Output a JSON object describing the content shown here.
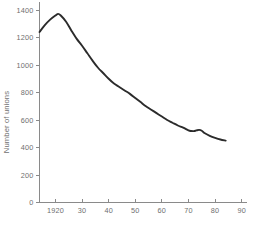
{
  "chart_data": {
    "type": "line",
    "title": "",
    "subtitle": "",
    "xlabel": "",
    "ylabel": "Number of unions",
    "xlim": [
      1914,
      1992
    ],
    "ylim": [
      0,
      1600
    ],
    "grid": false,
    "legend": null,
    "legend_position": "none",
    "y_ticks": [
      0,
      200,
      400,
      600,
      800,
      1000,
      1200,
      1400,
      1600
    ],
    "y_tick_labels": [
      "0",
      "200",
      "400",
      "600",
      "800",
      "1000",
      "1200",
      "1400",
      "1600"
    ],
    "y_top_label_clipped": true,
    "x_ticks": [
      1920,
      1930,
      1940,
      1950,
      1960,
      1970,
      1980,
      1990
    ],
    "x_tick_labels": [
      "1920",
      "30",
      "40",
      "50",
      "60",
      "70",
      "80",
      "90"
    ],
    "line_color": "#2b2b2b",
    "axis_color": "#8a8a8a",
    "text_color": "#6f6f6f",
    "background_color": "#ffffff",
    "series": [
      {
        "name": "Number of unions",
        "x": [
          1914,
          1916,
          1918,
          1920,
          1921,
          1922,
          1924,
          1926,
          1928,
          1930,
          1932,
          1934,
          1936,
          1938,
          1940,
          1942,
          1944,
          1946,
          1948,
          1950,
          1952,
          1954,
          1956,
          1958,
          1960,
          1962,
          1964,
          1966,
          1968,
          1970,
          1971,
          1972,
          1973,
          1974,
          1975,
          1976,
          1978,
          1980,
          1982,
          1984
        ],
        "values": [
          1240,
          1290,
          1330,
          1360,
          1372,
          1360,
          1315,
          1250,
          1190,
          1140,
          1085,
          1030,
          980,
          940,
          900,
          865,
          840,
          815,
          790,
          760,
          730,
          700,
          675,
          650,
          625,
          600,
          580,
          560,
          545,
          525,
          520,
          519,
          524,
          528,
          522,
          505,
          485,
          470,
          458,
          450
        ]
      }
    ]
  }
}
